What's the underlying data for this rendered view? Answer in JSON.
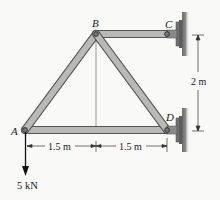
{
  "diagram": {
    "type": "truss",
    "joints": [
      {
        "id": "A",
        "label": "A",
        "x": 25,
        "y": 130,
        "support": "none"
      },
      {
        "id": "B",
        "label": "B",
        "x": 96,
        "y": 34,
        "support": "none"
      },
      {
        "id": "C",
        "label": "C",
        "x": 167,
        "y": 34,
        "support": "pin-wall"
      },
      {
        "id": "D",
        "label": "D",
        "x": 167,
        "y": 130,
        "support": "pin-wall"
      }
    ],
    "members": [
      {
        "from": "A",
        "to": "B"
      },
      {
        "from": "B",
        "to": "C"
      },
      {
        "from": "B",
        "to": "D"
      },
      {
        "from": "A",
        "to": "D"
      }
    ],
    "dimensions": {
      "horizontal_1": "1.5 m",
      "horizontal_2": "1.5 m",
      "vertical": "2 m"
    },
    "load": {
      "joint": "A",
      "label": "5 kN",
      "direction": "down"
    },
    "colors": {
      "member_fill": "#b9b9b7",
      "member_stroke": "#555555",
      "wall": "#7a7a7a",
      "line": "#222222",
      "background": "#f9f9f8"
    }
  }
}
